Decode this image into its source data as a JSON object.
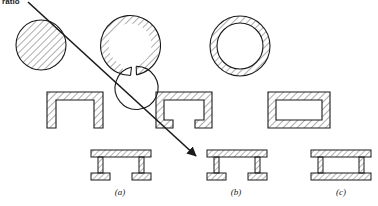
{
  "figure": {
    "top_text": "ratio",
    "captions": [
      {
        "text": "(a)",
        "x": 120,
        "y": 187
      },
      {
        "text": "(b)",
        "x": 236,
        "y": 187
      },
      {
        "text": "(c)",
        "x": 341,
        "y": 187
      }
    ],
    "colors": {
      "stroke": "#1a1a1a",
      "hatch": "#555555",
      "background": "#ffffff"
    },
    "arrow": {
      "name": "torsional-stiffness-arrow",
      "x1": 28,
      "y1": 2,
      "x2": 198,
      "y2": 158
    },
    "rows": [
      {
        "name": "circular-sections-row",
        "items": [
          {
            "name": "solid-circle-section",
            "label": "solid circular bar"
          },
          {
            "name": "split-ring-section",
            "label": "open split ring"
          },
          {
            "name": "closed-ring-section",
            "label": "closed hollow tube"
          }
        ]
      },
      {
        "name": "channel-sections-row",
        "items": [
          {
            "name": "open-channel-section",
            "label": "open channel"
          },
          {
            "name": "lipped-channel-section",
            "label": "partially closed channel"
          },
          {
            "name": "closed-box-section",
            "label": "closed rectangular box"
          }
        ]
      },
      {
        "name": "beam-sections-row",
        "items": [
          {
            "name": "open-double-web-beam",
            "label": "open double-web beam"
          },
          {
            "name": "split-flange-box-beam",
            "label": "split-flange box beam"
          },
          {
            "name": "closed-box-beam",
            "label": "closed box beam"
          }
        ]
      }
    ]
  }
}
